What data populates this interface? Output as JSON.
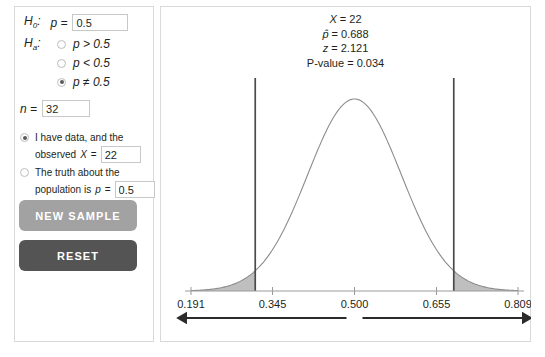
{
  "hypotheses": {
    "null_label": "H",
    "null_sub": "0",
    "null_colon": ":",
    "null_param": "p =",
    "null_value": "0.5",
    "alt_label": "H",
    "alt_sub": "a",
    "alt_colon": ":",
    "alternatives": [
      {
        "text": "p > 0.5",
        "selected": false
      },
      {
        "text": "p < 0.5",
        "selected": false
      },
      {
        "text": "p ≠ 0.5",
        "selected": true
      }
    ]
  },
  "sample_size": {
    "label": "n =",
    "value": "32"
  },
  "data_source": {
    "options": [
      {
        "line1": "I have data, and the",
        "line2_prefix": "observed",
        "line2_symbol": "X",
        "line2_eq": "=",
        "value": "22",
        "selected": true
      },
      {
        "line1": "The truth about the",
        "line2_prefix": "population is",
        "line2_symbol": "p",
        "line2_eq": "=",
        "value": "0.5",
        "selected": false
      }
    ]
  },
  "buttons": {
    "new_sample": "NEW SAMPLE",
    "reset": "RESET"
  },
  "stats": {
    "x_symbol": "X",
    "x_eq": " = 22",
    "phat_symbol": "p̂",
    "phat_eq": " = 0.688",
    "z_symbol": "z",
    "z_eq": " = 2.121",
    "pvalue": "P-value = 0.034"
  },
  "colors": {
    "curve": "#8c8c8c",
    "shade": "#bfbfbf",
    "cutoff_line": "#4a4a4a",
    "axis": "#9a9a9a",
    "arrow": "#2b2b2b",
    "new_sample_bg": "#a2a2a2",
    "reset_bg": "#545454",
    "panel_border": "#d9d9d9"
  },
  "chart_data": {
    "type": "area",
    "title": "",
    "xlabel": "",
    "ylabel": "",
    "distribution": "normal",
    "mean": 0.5,
    "sd": 0.0884,
    "xlim": [
      0.191,
      0.809
    ],
    "tick_values": [
      0.191,
      0.345,
      0.5,
      0.655,
      0.809
    ],
    "tick_labels": [
      "0.191",
      "0.345",
      "0.500",
      "0.655",
      "0.809"
    ],
    "cutoffs": [
      0.3124,
      0.6876
    ],
    "shaded_tails": [
      {
        "side": "left",
        "from": 0.191,
        "to": 0.3124
      },
      {
        "side": "right",
        "from": 0.6876,
        "to": 0.809
      }
    ],
    "tail_area_total": 0.034,
    "observed_phat": 0.688,
    "z": 2.121,
    "arrows": [
      {
        "direction": "left",
        "from": 0.5,
        "to": 0.191
      },
      {
        "direction": "right",
        "from": 0.5,
        "to": 0.809
      }
    ],
    "grid": false,
    "legend": false
  }
}
